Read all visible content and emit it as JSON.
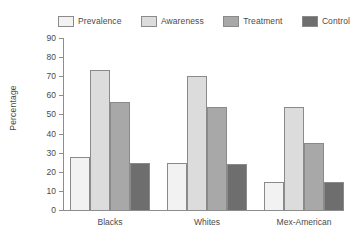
{
  "chart_data": {
    "type": "bar",
    "title": "",
    "subtitle": "",
    "xlabel": "",
    "ylabel": "Percentage",
    "ylim": [
      0,
      90
    ],
    "yticks": [
      0,
      10,
      20,
      30,
      40,
      50,
      60,
      70,
      80,
      90
    ],
    "grid": false,
    "legend_position": "top",
    "categories": [
      "Blacks",
      "Whites",
      "Mex-American"
    ],
    "series": [
      {
        "name": "Prevalence",
        "color": "#f2f2f2",
        "values": [
          28,
          24.5,
          14.5
        ]
      },
      {
        "name": "Awareness",
        "color": "#dcdcdc",
        "values": [
          73.5,
          70,
          54
        ]
      },
      {
        "name": "Treatment",
        "color": "#a8a8a8",
        "values": [
          56.5,
          54,
          35
        ]
      },
      {
        "name": "Control",
        "color": "#6e6e6e",
        "values": [
          24.5,
          24,
          14.5
        ]
      }
    ],
    "bar_border_color": "#8a8a8a",
    "axis_color": "#8d8d8d",
    "text_color": "#4a4a4a"
  },
  "legend": {
    "entries": [
      {
        "label": "Prevalence",
        "swatch": "legend-swatch-prevalence"
      },
      {
        "label": "Awareness",
        "swatch": "legend-swatch-awareness"
      },
      {
        "label": "Treatment",
        "swatch": "legend-swatch-treatment"
      },
      {
        "label": "Control",
        "swatch": "legend-swatch-control"
      }
    ]
  },
  "caption_fragment": "",
  "axis": {
    "y_title": "Percentage",
    "tick_labels": [
      "90",
      "80",
      "70",
      "60",
      "50",
      "40",
      "30",
      "20",
      "10",
      "0"
    ]
  }
}
